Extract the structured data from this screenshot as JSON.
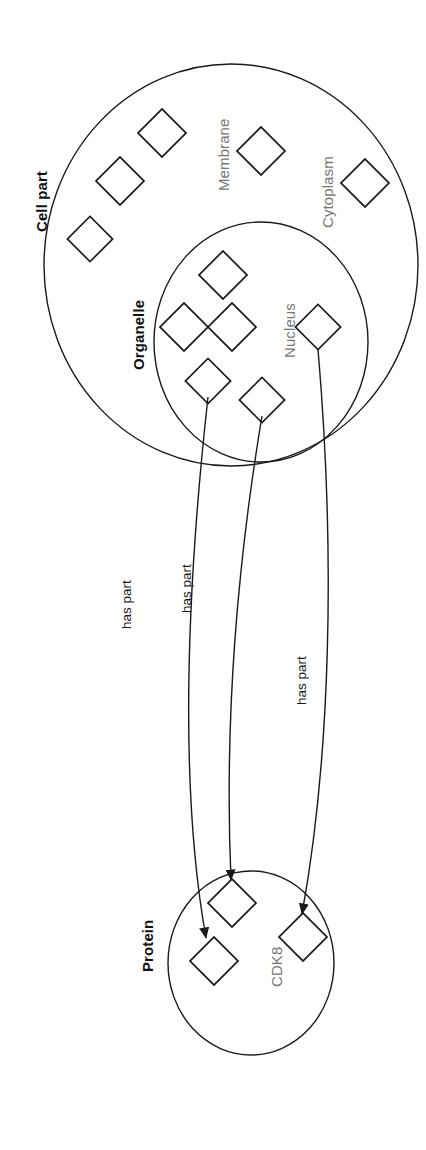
{
  "diagram": {
    "stroke_color": "#1a1a1a",
    "label_gray": "#777777",
    "label_black": "#111111",
    "background": "#ffffff",
    "orientation": "rotated-90-ccw",
    "groups": [
      {
        "id": "cell-part",
        "label": "Cell part",
        "style": "bold",
        "shape": "circle"
      },
      {
        "id": "organelle",
        "label": "Organelle",
        "style": "bold",
        "shape": "circle"
      },
      {
        "id": "protein",
        "label": "Protein",
        "style": "bold",
        "shape": "circle"
      }
    ],
    "node_labels": [
      {
        "id": "membrane",
        "label": "Membrane",
        "style": "gray",
        "group": "cell-part"
      },
      {
        "id": "cytoplasm",
        "label": "Cytoplasm",
        "style": "gray",
        "group": "cell-part"
      },
      {
        "id": "nucleus",
        "label": "Nucleus",
        "style": "gray",
        "group": "organelle"
      },
      {
        "id": "cdk8",
        "label": "CDK8",
        "style": "gray",
        "group": "protein"
      }
    ],
    "edges": [
      {
        "id": "edge-1",
        "label": "has part",
        "from": "organelle-node-a",
        "to": "protein-node-a"
      },
      {
        "id": "edge-2",
        "label": "has part",
        "from": "organelle-node-b",
        "to": "protein-node-b"
      },
      {
        "id": "edge-3",
        "label": "has part",
        "from": "nucleus-node",
        "to": "protein-node-c"
      }
    ],
    "node_counts": {
      "cell_part_diamonds": 5,
      "organelle_diamonds": 6,
      "protein_diamonds": 3
    }
  }
}
